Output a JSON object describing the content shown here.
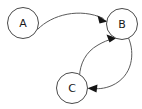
{
  "diagram": {
    "type": "directed-graph",
    "background_color": "#ffffff",
    "node_stroke_color": "#4a4a4a",
    "node_fill_color": "#ffffff",
    "edge_color": "#5a5a5a",
    "arrow_color": "#141414",
    "label_color": "#1a1a1a",
    "nodes": [
      {
        "id": "A",
        "label": "A",
        "cx": 23,
        "cy": 23,
        "r": 15.5
      },
      {
        "id": "B",
        "label": "B",
        "cx": 122,
        "cy": 24,
        "r": 15.5
      },
      {
        "id": "C",
        "label": "C",
        "cx": 72,
        "cy": 88,
        "r": 15.5
      }
    ],
    "edges": [
      {
        "id": "a-to-b",
        "from": "A",
        "to": "B",
        "label": "",
        "direction": "A to B",
        "curve": "arc-above"
      },
      {
        "id": "b-to-c",
        "from": "B",
        "to": "C",
        "label": "",
        "direction": "B to C",
        "curve": "bulge-right"
      },
      {
        "id": "c-to-b",
        "from": "C",
        "to": "B",
        "label": "",
        "direction": "C to B",
        "curve": "bulge-left"
      }
    ]
  }
}
